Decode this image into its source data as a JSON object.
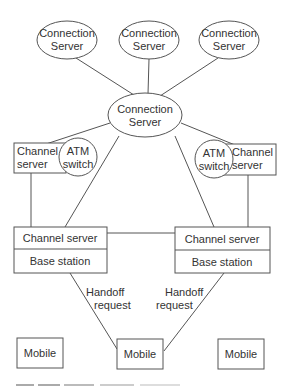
{
  "diagram": {
    "top_connection_servers": [
      {
        "line1": "Connection",
        "line2": "Server"
      },
      {
        "line1": "Connection",
        "line2": "Server"
      },
      {
        "line1": "Connection",
        "line2": "Server"
      }
    ],
    "central_connection_server": {
      "line1": "Connection",
      "line2": "Server"
    },
    "left_channel_server": {
      "line1": "Channel",
      "line2": "server"
    },
    "left_atm_switch": {
      "line1": "ATM",
      "line2": "switch"
    },
    "right_atm_switch": {
      "line1": "ATM",
      "line2": "switch"
    },
    "right_channel_server": {
      "line1": "Channel",
      "line2": "server"
    },
    "left_base_unit": {
      "top": "Channel server",
      "bottom": "Base station"
    },
    "right_base_unit": {
      "top": "Channel server",
      "bottom": "Base station"
    },
    "handoff_left": {
      "line1": "Handoff",
      "line2": "request"
    },
    "handoff_right": {
      "line1": "Handoff",
      "line2": "request"
    },
    "mobiles": [
      {
        "label": "Mobile"
      },
      {
        "label": "Mobile"
      },
      {
        "label": "Mobile"
      }
    ],
    "stroke_color": "#555555"
  }
}
